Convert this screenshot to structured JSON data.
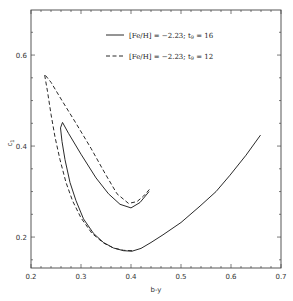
{
  "chart_data": {
    "type": "line",
    "title": "",
    "xlabel": "b-y",
    "ylabel": "c1",
    "xlim": [
      0.2,
      0.7
    ],
    "ylim": [
      0.132,
      0.699
    ],
    "x_ticks": [
      0.2,
      0.3,
      0.4,
      0.5,
      0.6,
      0.7
    ],
    "x_tick_labels": [
      "0.2",
      "0.3",
      "0.4",
      "0.5",
      "0.6",
      "0.7"
    ],
    "x_minor_step": 0.02,
    "y_ticks": [
      0.2,
      0.4,
      0.6
    ],
    "y_tick_labels": [
      "0.2",
      "0.4",
      "0.6"
    ],
    "y_minor_step": 0.05,
    "grid": false,
    "legend_position": "upper center",
    "series": [
      {
        "name": "[Fe/H] = −2.23; t9 = 16",
        "legend_main": "[Fe/H] = −2.23; t",
        "legend_sub": "9",
        "legend_tail": " = 16",
        "style": "solid",
        "points": [
          [
            0.659,
            0.424
          ],
          [
            0.63,
            0.38
          ],
          [
            0.598,
            0.336
          ],
          [
            0.57,
            0.3
          ],
          [
            0.538,
            0.268
          ],
          [
            0.5,
            0.232
          ],
          [
            0.464,
            0.205
          ],
          [
            0.44,
            0.188
          ],
          [
            0.42,
            0.175
          ],
          [
            0.402,
            0.169
          ],
          [
            0.385,
            0.17
          ],
          [
            0.365,
            0.176
          ],
          [
            0.345,
            0.188
          ],
          [
            0.325,
            0.208
          ],
          [
            0.305,
            0.24
          ],
          [
            0.29,
            0.28
          ],
          [
            0.278,
            0.32
          ],
          [
            0.268,
            0.37
          ],
          [
            0.262,
            0.41
          ],
          [
            0.259,
            0.44
          ],
          [
            0.263,
            0.452
          ],
          [
            0.275,
            0.428
          ],
          [
            0.3,
            0.382
          ],
          [
            0.33,
            0.33
          ],
          [
            0.355,
            0.295
          ],
          [
            0.378,
            0.272
          ],
          [
            0.4,
            0.264
          ],
          [
            0.418,
            0.276
          ],
          [
            0.436,
            0.3
          ]
        ]
      },
      {
        "name": "[Fe/H] = −2.23; t9 = 12",
        "legend_main": "[Fe/H] = −2.23; t",
        "legend_sub": "9",
        "legend_tail": " = 12",
        "style": "dashed",
        "points": [
          [
            0.402,
            0.17
          ],
          [
            0.385,
            0.171
          ],
          [
            0.365,
            0.176
          ],
          [
            0.345,
            0.187
          ],
          [
            0.322,
            0.208
          ],
          [
            0.3,
            0.242
          ],
          [
            0.283,
            0.28
          ],
          [
            0.27,
            0.32
          ],
          [
            0.258,
            0.37
          ],
          [
            0.248,
            0.42
          ],
          [
            0.24,
            0.47
          ],
          [
            0.233,
            0.52
          ],
          [
            0.227,
            0.558
          ],
          [
            0.24,
            0.54
          ],
          [
            0.262,
            0.5
          ],
          [
            0.29,
            0.45
          ],
          [
            0.32,
            0.395
          ],
          [
            0.348,
            0.34
          ],
          [
            0.372,
            0.295
          ],
          [
            0.395,
            0.274
          ],
          [
            0.412,
            0.278
          ],
          [
            0.425,
            0.29
          ],
          [
            0.438,
            0.306
          ]
        ]
      }
    ]
  },
  "colors": {
    "line": "#2a2a2a",
    "axis": "#444444",
    "background": "#ffffff"
  }
}
